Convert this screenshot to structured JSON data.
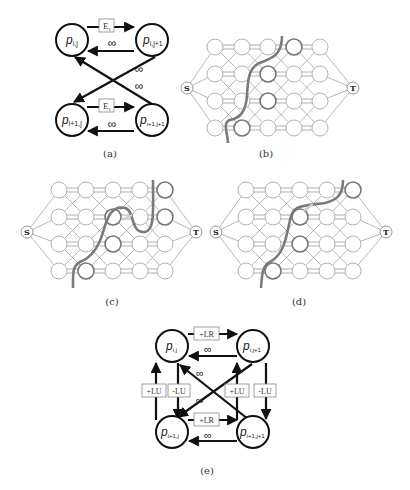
{
  "figure": {
    "panels": [
      {
        "id": "a",
        "caption": "(a)"
      },
      {
        "id": "b",
        "caption": "(b)"
      },
      {
        "id": "c",
        "caption": "(c)"
      },
      {
        "id": "d",
        "caption": "(d)"
      },
      {
        "id": "e",
        "caption": "(e)"
      }
    ]
  },
  "panel_a": {
    "caption": "(a)",
    "nodes": {
      "tl": {
        "base": "p",
        "sub": "i,j"
      },
      "tr": {
        "base": "p",
        "sub": "i,j+1"
      },
      "bl": {
        "base": "p",
        "sub": "i+1,j"
      },
      "br": {
        "base": "p",
        "sub": "i+1,j+1"
      }
    },
    "edge_labels": {
      "top_forward": "E",
      "top_forward_sub": "1",
      "top_back": "∞",
      "bottom_forward": "E",
      "bottom_forward_sub": "1",
      "bottom_back": "∞",
      "cross_1": "∞",
      "cross_2": "∞"
    }
  },
  "grid_panels": {
    "source_label": "S",
    "sink_label": "T",
    "rows": 4,
    "cols": 5,
    "cut_color": "#7a7a7a",
    "node_stroke": "#999999",
    "b": {
      "caption": "(b)"
    },
    "c": {
      "caption": "(c)"
    },
    "d": {
      "caption": "(d)"
    }
  },
  "panel_e": {
    "caption": "(e)",
    "nodes": {
      "tl": {
        "base": "p",
        "sub": "i,j"
      },
      "tr": {
        "base": "p",
        "sub": "i,j+1"
      },
      "bl": {
        "base": "p",
        "sub": "i+1,j"
      },
      "br": {
        "base": "p",
        "sub": "i+1,j+1"
      }
    },
    "edge_labels": {
      "top_forward": "+LR",
      "top_back": "∞",
      "bottom_forward": "+LR",
      "bottom_back": "∞",
      "left_up": "+LU",
      "left_down": "-LU",
      "right_up": "+LU",
      "right_down": "-LU",
      "cross_1": "∞",
      "cross_2": "∞"
    }
  }
}
